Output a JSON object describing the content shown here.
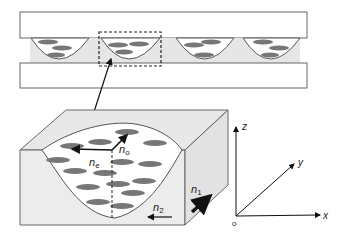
{
  "diagram": {
    "type": "liquid-crystal microlens cell schematic",
    "colors": {
      "outline": "#555555",
      "fill_light": "#e6e6e6",
      "glass": "#ffffff",
      "lc_molecule": "#7a7a7a",
      "arrow": "#111111"
    },
    "top_panel": {
      "lens_count": 4,
      "highlight_box": "dashed"
    },
    "block_labels": {
      "n_e": {
        "base": "n",
        "sub": "e"
      },
      "n_o": {
        "base": "n",
        "sub": "o"
      },
      "n_1": {
        "base": "n",
        "sub": "1"
      },
      "n_2": {
        "base": "n",
        "sub": "2"
      }
    },
    "axes": {
      "z": "z",
      "y": "y",
      "x": "x",
      "origin": "o"
    }
  }
}
